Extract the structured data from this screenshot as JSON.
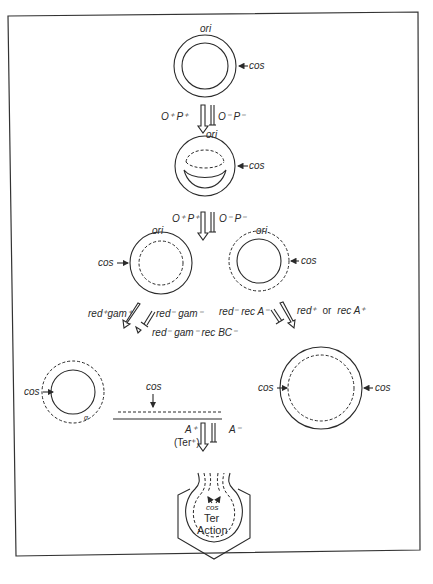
{
  "figure": {
    "stage1": {
      "ori": "ori",
      "cos": "cos"
    },
    "step1": {
      "left": "O⁺ P⁺",
      "right": "O⁻ P⁻"
    },
    "stage2": {
      "ori": "ori",
      "cos": "cos"
    },
    "step2": {
      "left": "O⁺ P⁺",
      "right": "O⁻ P⁻"
    },
    "stage3_left": {
      "ori": "ori",
      "cos": "cos"
    },
    "stage3_right": {
      "ori": "ori",
      "cos": "cos"
    },
    "branch_left": {
      "a": "red⁺gam⁺",
      "b": "red⁻ gam⁻",
      "c": "red⁻ gam⁻ rec BC⁻"
    },
    "branch_right": {
      "a": "red⁻ rec A⁻",
      "b_pre": "red⁺",
      "b_or": "or",
      "b_post": "rec A⁺"
    },
    "stage4_left": {
      "cos": "cos",
      "cos_linear": "cos",
      "small": "α"
    },
    "stage4_right": {
      "cos_left": "cos",
      "cos_right": "cos"
    },
    "step4": {
      "left_top": "A⁺",
      "left_bottom": "(Ter⁺)",
      "right": "A⁻"
    },
    "stage5": {
      "cos": "cos",
      "ter": "Ter",
      "action": "Action"
    }
  }
}
